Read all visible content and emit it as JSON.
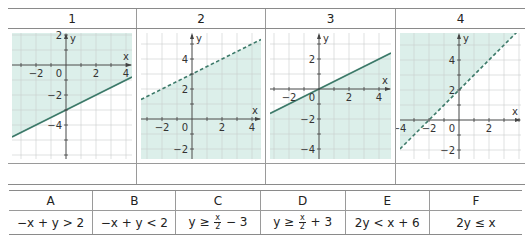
{
  "graphs_table": {
    "headers": [
      "1",
      "2",
      "3",
      "4"
    ],
    "colors": {
      "shade": "#dcefea",
      "line": "#3d7a6a",
      "grid": "#c9cfcd",
      "axis": "#444444"
    },
    "graphs": [
      {
        "label": "1",
        "unit_px": 15,
        "origin": [
          58,
          36
        ],
        "xlim": [
          -3.6,
          4.4
        ],
        "ylim": [
          -6.2,
          2.6
        ],
        "x_ticks": [
          "-2",
          "0",
          "2",
          "4"
        ],
        "y_ticks": [
          "2",
          "-2",
          "-4"
        ],
        "boundary": "y = x/2 - 3",
        "slope": 0.5,
        "intercept": -3,
        "line_style": "solid",
        "shaded": "above"
      },
      {
        "label": "2",
        "unit_px": 15,
        "origin": [
          55,
          90
        ],
        "xlim": [
          -3.7,
          4.6
        ],
        "ylim": [
          -2.6,
          5.8
        ],
        "x_ticks": [
          "-2",
          "0",
          "2",
          "4"
        ],
        "y_ticks": [
          "4",
          "2",
          "-2"
        ],
        "boundary": "y = x/2 + 3",
        "slope": 0.5,
        "intercept": 3,
        "line_style": "dashed",
        "shaded": "below"
      },
      {
        "label": "3",
        "unit_px": 15,
        "origin": [
          53,
          60
        ],
        "xlim": [
          -3.5,
          4.6
        ],
        "ylim": [
          -4.9,
          3.9
        ],
        "x_ticks": [
          "-2",
          "0",
          "2",
          "4"
        ],
        "y_ticks": [
          "2",
          "-2",
          "-4"
        ],
        "boundary": "y = x/2",
        "slope": 0.5,
        "intercept": 0,
        "line_style": "solid",
        "shaded": "below"
      },
      {
        "label": "4",
        "unit_px": 15,
        "origin": [
          63,
          91
        ],
        "xlim": [
          -4.2,
          3.7
        ],
        "ylim": [
          -2.6,
          6.0
        ],
        "x_ticks": [
          "-4",
          "-2",
          "0",
          "2"
        ],
        "y_ticks": [
          "4",
          "2",
          "-2"
        ],
        "boundary": "y = x + 2",
        "slope": 1,
        "intercept": 2,
        "line_style": "dashed",
        "shaded": "above"
      }
    ],
    "axis_labels": {
      "x": "x",
      "y": "y"
    }
  },
  "inequalities_table": {
    "headers": [
      "A",
      "B",
      "C",
      "D",
      "E",
      "F"
    ],
    "cells": [
      {
        "text": "−x + y > 2"
      },
      {
        "text": "−x + y < 2"
      },
      {
        "pre": "y ≥ ",
        "num": "x",
        "den": "2",
        "post": " − 3"
      },
      {
        "pre": "y ≥ ",
        "num": "x",
        "den": "2",
        "post": " + 3"
      },
      {
        "text": "2y < x + 6"
      },
      {
        "text": "2y ≤ x"
      }
    ]
  }
}
